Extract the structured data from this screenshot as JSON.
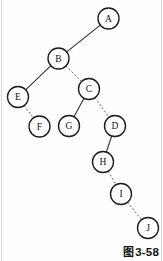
{
  "figure": {
    "caption_cjk": "图",
    "caption_number": "3-58",
    "caption_full": "图 3-58"
  },
  "diagram": {
    "type": "binary-tree",
    "title": "",
    "node_radius": 10.5,
    "colors": {
      "node_fill": "#ffffff",
      "node_stroke": "#1a1a1a",
      "solid_edge": "#2b2b2b",
      "dashed_edge": "#6b6b6b",
      "background": "#fefefe",
      "caption_text": "#121212"
    },
    "nodes": [
      {
        "id": "A",
        "label": "A",
        "x": 108.5,
        "y": 18.5
      },
      {
        "id": "B",
        "label": "B",
        "x": 58.5,
        "y": 58.5
      },
      {
        "id": "C",
        "label": "C",
        "x": 89.0,
        "y": 89.0
      },
      {
        "id": "E",
        "label": "E",
        "x": 18.0,
        "y": 97.0
      },
      {
        "id": "F",
        "label": "F",
        "x": 39.5,
        "y": 126.5
      },
      {
        "id": "G",
        "label": "G",
        "x": 69.0,
        "y": 126.0
      },
      {
        "id": "D",
        "label": "D",
        "x": 115.0,
        "y": 126.0
      },
      {
        "id": "H",
        "label": "H",
        "x": 103.0,
        "y": 162.0
      },
      {
        "id": "I",
        "label": "I",
        "x": 121.0,
        "y": 194.0
      },
      {
        "id": "J",
        "label": "J",
        "x": 148.0,
        "y": 228.0
      }
    ],
    "edges": [
      {
        "from": "A",
        "to": "B",
        "style": "solid",
        "relation": "left-child"
      },
      {
        "from": "B",
        "to": "E",
        "style": "solid",
        "relation": "left-child"
      },
      {
        "from": "B",
        "to": "C",
        "style": "dashed",
        "relation": "right-child"
      },
      {
        "from": "E",
        "to": "F",
        "style": "dashed",
        "relation": "right-child"
      },
      {
        "from": "C",
        "to": "G",
        "style": "solid",
        "relation": "left-child"
      },
      {
        "from": "C",
        "to": "D",
        "style": "dashed",
        "relation": "right-child"
      },
      {
        "from": "D",
        "to": "H",
        "style": "solid",
        "relation": "left-child"
      },
      {
        "from": "H",
        "to": "I",
        "style": "dashed",
        "relation": "right-child"
      },
      {
        "from": "I",
        "to": "J",
        "style": "dashed",
        "relation": "right-child"
      }
    ]
  }
}
